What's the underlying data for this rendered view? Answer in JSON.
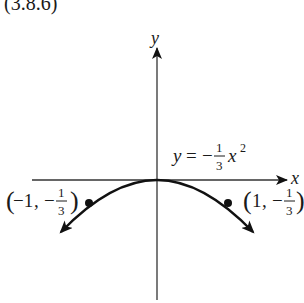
{
  "figure": {
    "label": "(3.8.6)",
    "type": "parabola graph",
    "equation": {
      "lhs": "y",
      "eq": "=",
      "sign": "−",
      "num": "1",
      "den": "3",
      "var": "x",
      "exp": "2",
      "text": "y = −(1/3)x²"
    },
    "axes": {
      "x_label": "x",
      "y_label": "y"
    },
    "points": [
      {
        "label_open": "(",
        "x": "−1",
        "comma": ",",
        "sign": "−",
        "num": "1",
        "den": "3",
        "label_close": ")",
        "text": "(−1, −1/3)"
      },
      {
        "label_open": "(",
        "x": "1",
        "comma": ",",
        "sign": "−",
        "num": "1",
        "den": "3",
        "label_close": ")",
        "text": "(1, −1/3)"
      }
    ],
    "colors": {
      "curve": "#111111",
      "axis": "#333333",
      "text": "#1a1a1a"
    }
  }
}
